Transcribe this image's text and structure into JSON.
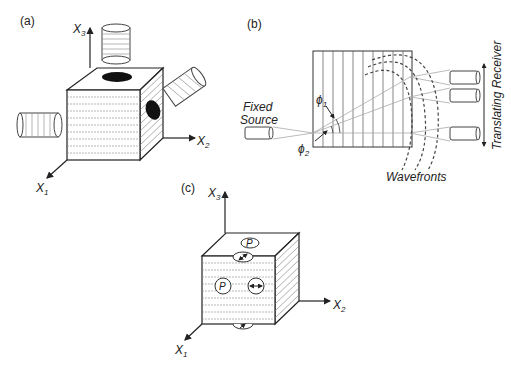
{
  "panels": {
    "a": {
      "label": "(a)",
      "axes": {
        "x1": "X",
        "x1_sub": "1",
        "x2": "X",
        "x2_sub": "2",
        "x3": "X",
        "x3_sub": "3"
      }
    },
    "b": {
      "label": "(b)",
      "fixed_source_line1": "Fixed",
      "fixed_source_line2": "Source",
      "phi1": "ϕ",
      "phi1_sub": "1",
      "phi2": "ϕ",
      "phi2_sub": "2",
      "wavefronts": "Wavefronts",
      "receiver": "Translating Receiver"
    },
    "c": {
      "label": "(c)",
      "axes": {
        "x1": "X",
        "x1_sub": "1",
        "x2": "X",
        "x2_sub": "2",
        "x3": "X",
        "x3_sub": "3"
      },
      "p_top": "P",
      "p_front": "P"
    }
  },
  "colors": {
    "ink": "#222222",
    "hatch": "#888888",
    "ray": "#aaaaaa"
  }
}
